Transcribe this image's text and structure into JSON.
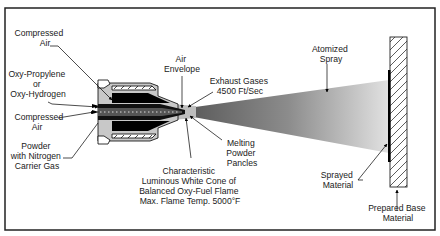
{
  "diagram": {
    "colors": {
      "frame": "#222222",
      "gun_body": "#000000",
      "gun_fill": "#c8c8c8",
      "spray_dark": "#6e6e6e",
      "spray_light": "#dcdcdc",
      "substrate_hatch": "#333333"
    },
    "labels": {
      "compressed_air_top": [
        "Compressed",
        "Air"
      ],
      "oxy_fuel": [
        "Oxy-Propylene",
        "or",
        "Oxy-Hydrogen"
      ],
      "compressed_air_mid": [
        "Compressed",
        "Air"
      ],
      "powder": [
        "Powder",
        "with Nitrogen",
        "Carrier Gas"
      ],
      "air_envelope": [
        "Air",
        "Envelope"
      ],
      "exhaust": [
        "Exhaust Gases",
        "4500 Ft/Sec"
      ],
      "melting": [
        "Melting",
        "Powder",
        "Pancles"
      ],
      "flame": [
        "Characteristic",
        "Luminous White Cone of",
        "Balanced Oxy-Fuel Flame",
        "Max. Flame Temp. 5000°F"
      ],
      "atomized": [
        "Atomized",
        "Spray"
      ],
      "sprayed": [
        "Sprayed",
        "Material"
      ],
      "base": [
        "Prepared Base",
        "Material"
      ]
    }
  }
}
